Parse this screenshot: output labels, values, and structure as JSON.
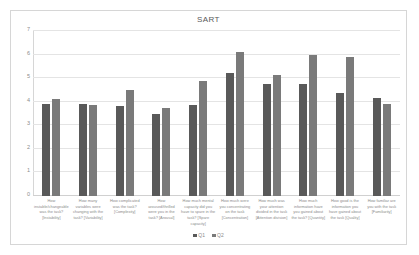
{
  "chart_data": {
    "type": "bar",
    "title": "SART",
    "xlabel": "",
    "ylabel": "",
    "ylim": [
      0,
      7
    ],
    "yticks": [
      0,
      1,
      2,
      3,
      4,
      5,
      6,
      7
    ],
    "grid": true,
    "legend_position": "bottom",
    "categories": [
      "How instable/changeable was the task? [Instability]",
      "How many variables were changing with the task? [Variability]",
      "How complicated was the task? [Complexity]",
      "How aroused/thrilled were you in the task? [Arousal]",
      "How much mental capacity did you have to spare in the task? [Spare capacity]",
      "How much were you concentrating on the task [Concentration]",
      "How much was your attention divided in the task [Attention division]",
      "How much information have you gained about the task? [Quantity]",
      "How good is the information you have gained about the task [Quality]",
      "How familiar are you with the task [Familiarity]"
    ],
    "series": [
      {
        "name": "Q1",
        "color": "#595959",
        "values": [
          3.9,
          3.9,
          3.8,
          3.5,
          3.85,
          5.2,
          4.75,
          4.75,
          4.35,
          4.15
        ]
      },
      {
        "name": "Q2",
        "color": "#7a7a7a",
        "values": [
          4.1,
          3.88,
          4.5,
          3.75,
          4.9,
          6.1,
          5.15,
          6.0,
          5.9,
          3.9
        ]
      }
    ]
  }
}
